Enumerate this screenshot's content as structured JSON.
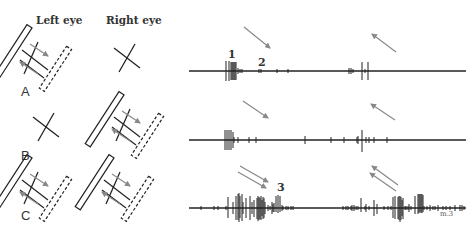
{
  "figure": {
    "headers": {
      "left_eye": "Left eye",
      "right_eye": "Right eye"
    },
    "panels": [
      {
        "label": "A",
        "left_eye": "moving-bar",
        "right_eye": "cross",
        "spike_markers": [
          "1",
          "2"
        ]
      },
      {
        "label": "B",
        "left_eye": "cross",
        "right_eye": "moving-bar",
        "spike_markers": []
      },
      {
        "label": "C",
        "left_eye": "moving-bar",
        "right_eye": "moving-bar",
        "spike_markers": [
          "3"
        ]
      }
    ],
    "corner_note": "m.3",
    "colors": {
      "ink": "#222222",
      "arrow": "#888888",
      "background": "#ffffff"
    }
  }
}
